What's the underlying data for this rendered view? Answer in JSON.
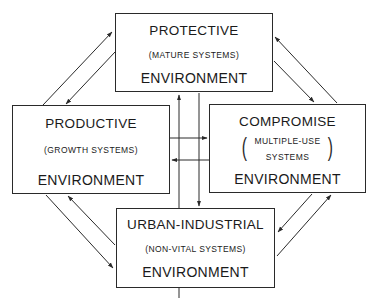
{
  "diagram": {
    "nodes": [
      {
        "id": "protective",
        "title": "PROTECTIVE",
        "subtitle": "(MATURE SYSTEMS)",
        "footer": "ENVIRONMENT"
      },
      {
        "id": "productive",
        "title": "PRODUCTIVE",
        "subtitle": "(GROWTH SYSTEMS)",
        "footer": "ENVIRONMENT"
      },
      {
        "id": "compromise",
        "title": "COMPROMISE",
        "subtitle_line1": "MULTIPLE-USE",
        "subtitle_line2": "SYSTEMS",
        "footer": "ENVIRONMENT"
      },
      {
        "id": "urban",
        "title": "URBAN-INDUSTRIAL",
        "subtitle": "(NON-VITAL SYSTEMS)",
        "footer": "ENVIRONMENT"
      }
    ],
    "edges": [
      {
        "from": "productive",
        "to": "protective"
      },
      {
        "from": "protective",
        "to": "productive"
      },
      {
        "from": "protective",
        "to": "compromise"
      },
      {
        "from": "compromise",
        "to": "protective"
      },
      {
        "from": "productive",
        "to": "urban"
      },
      {
        "from": "urban",
        "to": "productive"
      },
      {
        "from": "compromise",
        "to": "urban"
      },
      {
        "from": "urban",
        "to": "compromise"
      },
      {
        "from": "urban",
        "to": "protective"
      },
      {
        "from": "protective",
        "to": "urban"
      },
      {
        "from": "productive",
        "to": "compromise"
      },
      {
        "from": "compromise",
        "to": "productive"
      }
    ],
    "colors": {
      "line": "#2a2a2a",
      "background": "#ffffff"
    }
  }
}
